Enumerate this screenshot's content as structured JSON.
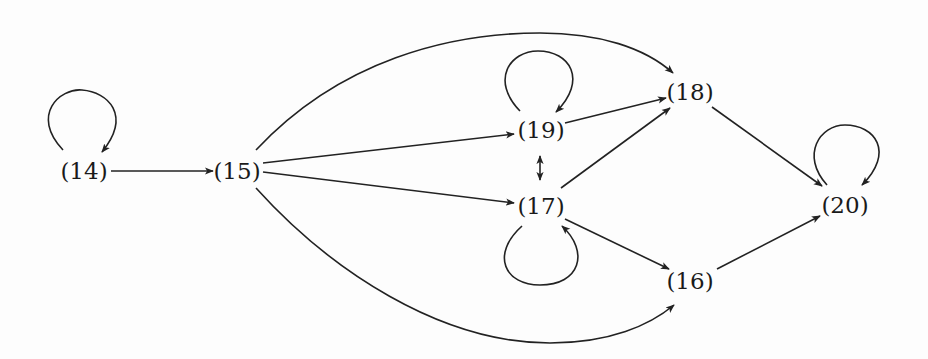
{
  "diagram": {
    "type": "directed-graph",
    "colors": {
      "stroke": "#222222",
      "text": "#1a1a1a",
      "background": "#fdfdfd"
    },
    "nodes": [
      {
        "id": "14",
        "label": "(14)",
        "x": 84,
        "y": 170
      },
      {
        "id": "15",
        "label": "(15)",
        "x": 237,
        "y": 170
      },
      {
        "id": "19",
        "label": "(19)",
        "x": 541,
        "y": 130
      },
      {
        "id": "17",
        "label": "(17)",
        "x": 541,
        "y": 206
      },
      {
        "id": "18",
        "label": "(18)",
        "x": 690,
        "y": 92
      },
      {
        "id": "20",
        "label": "(20)",
        "x": 845,
        "y": 205
      },
      {
        "id": "16",
        "label": "(16)",
        "x": 690,
        "y": 281
      }
    ],
    "edges": [
      {
        "from": "14",
        "to": "14",
        "kind": "self-loop"
      },
      {
        "from": "14",
        "to": "15"
      },
      {
        "from": "15",
        "to": "18",
        "kind": "curved-top"
      },
      {
        "from": "15",
        "to": "19"
      },
      {
        "from": "15",
        "to": "17"
      },
      {
        "from": "15",
        "to": "16",
        "kind": "curved-bottom"
      },
      {
        "from": "19",
        "to": "19",
        "kind": "self-loop"
      },
      {
        "from": "19",
        "to": "18"
      },
      {
        "from": "19",
        "to": "17",
        "kind": "bidirectional"
      },
      {
        "from": "17",
        "to": "18"
      },
      {
        "from": "17",
        "to": "17",
        "kind": "self-loop"
      },
      {
        "from": "17",
        "to": "16"
      },
      {
        "from": "18",
        "to": "20"
      },
      {
        "from": "16",
        "to": "20"
      },
      {
        "from": "20",
        "to": "20",
        "kind": "self-loop"
      }
    ]
  }
}
